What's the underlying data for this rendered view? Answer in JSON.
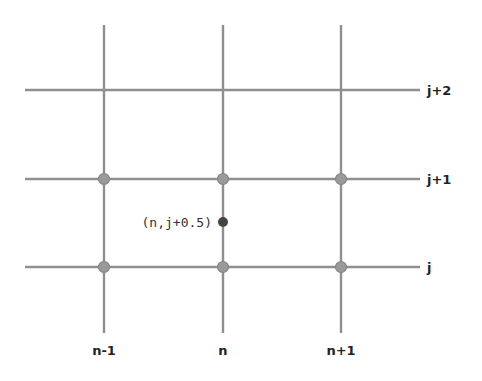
{
  "diagram": {
    "type": "finite-difference-grid",
    "column_labels": [
      "n-1",
      "n",
      "n+1"
    ],
    "row_labels": [
      "j",
      "j+1",
      "j+2"
    ],
    "grid_nodes_marked": [
      {
        "col": "n-1",
        "row": "j"
      },
      {
        "col": "n",
        "row": "j"
      },
      {
        "col": "n+1",
        "row": "j"
      },
      {
        "col": "n-1",
        "row": "j+1"
      },
      {
        "col": "n",
        "row": "j+1"
      },
      {
        "col": "n+1",
        "row": "j+1"
      }
    ],
    "half_point": {
      "label": "(n,j+0.5)",
      "col": "n",
      "row": "j+0.5"
    },
    "colors": {
      "grid_line": "#8f8f8f",
      "node": "#9a9a9a",
      "half_point": "#444444"
    }
  }
}
